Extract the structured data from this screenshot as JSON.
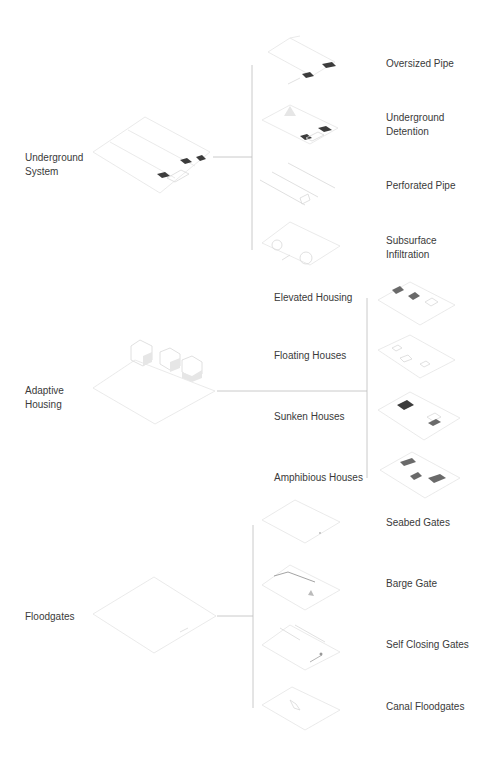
{
  "groups": [
    {
      "label_lines": [
        "Underground",
        "System"
      ],
      "children": [
        {
          "label_lines": [
            "Oversized Pipe"
          ]
        },
        {
          "label_lines": [
            "Underground",
            "Detention"
          ]
        },
        {
          "label_lines": [
            "Perforated Pipe"
          ]
        },
        {
          "label_lines": [
            "Subsurface",
            "Infiltration"
          ]
        }
      ]
    },
    {
      "label_lines": [
        "Adaptive",
        "Housing"
      ],
      "children": [
        {
          "label_lines": [
            "Elevated Housing"
          ]
        },
        {
          "label_lines": [
            "Floating Houses"
          ]
        },
        {
          "label_lines": [
            "Sunken Houses"
          ]
        },
        {
          "label_lines": [
            "Amphibious Houses"
          ]
        }
      ]
    },
    {
      "label_lines": [
        "Floodgates"
      ],
      "children": [
        {
          "label_lines": [
            "Seabed Gates"
          ]
        },
        {
          "label_lines": [
            "Barge Gate"
          ]
        },
        {
          "label_lines": [
            "Self Closing Gates"
          ]
        },
        {
          "label_lines": [
            "Canal Floodgates"
          ]
        }
      ]
    }
  ],
  "colors": {
    "text": "#3a3a3a",
    "connector": "#bdbdbd",
    "drawing_line": "#e4e4e4",
    "background": "#ffffff"
  }
}
